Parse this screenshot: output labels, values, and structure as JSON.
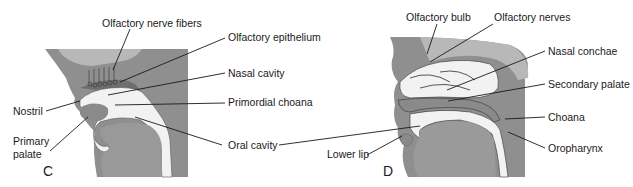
{
  "figure": {
    "panels": [
      {
        "id": "C",
        "letter": "C",
        "labels": {
          "olfactory_nerve_fibers": "Olfactory nerve fibers",
          "olfactory_epithelium": "Olfactory epithelium",
          "nasal_cavity": "Nasal cavity",
          "nostril": "Nostril",
          "primordial_choana": "Primordial choana",
          "primary_palate_line1": "Primary",
          "primary_palate_line2": "palate",
          "oral_cavity": "Oral cavity"
        }
      },
      {
        "id": "D",
        "letter": "D",
        "labels": {
          "olfactory_bulb": "Olfactory bulb",
          "olfactory_nerves": "Olfactory nerves",
          "nasal_conchae": "Nasal conchae",
          "secondary_palate": "Secondary palate",
          "choana": "Choana",
          "lower_lip": "Lower lip",
          "oropharynx": "Oropharynx"
        }
      }
    ],
    "colors": {
      "tissue_dark": "#8a8a8a",
      "tissue_mid": "#a8a8a8",
      "tissue_light": "#c4c4c4",
      "cavity": "#f4f4f4",
      "background": "#ffffff"
    }
  }
}
